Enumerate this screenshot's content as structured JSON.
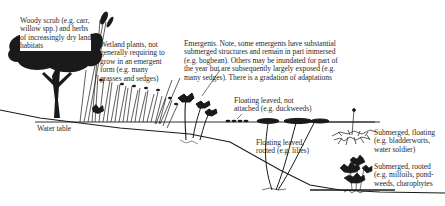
{
  "diagram": {
    "type": "wetland-plant-zonation-cross-section",
    "colors": {
      "ink": "#1a1a1a",
      "text": "#2b2b2b",
      "background": "#ffffff"
    },
    "water_table_label": "Water table",
    "zones": [
      {
        "id": "woody-scrub",
        "text": "Woody scrub (e.g. carr,\nwillow spp.) and herbs\nof increasingly dry land\nhabitats"
      },
      {
        "id": "wetland-plants",
        "text": "Wetland plants, not\ngenerally requiring to\ngrow in an emergent\nform (e.g. many\ngrasses and sedges)"
      },
      {
        "id": "emergents",
        "text": "Emergents. Note, some emergents have substantial\nsubmerged structures and remain in part immersed\n(e.g. bogbean). Others may be inundated for part of\nthe year but are subsequently largely exposed (e.g.\nmany sedges). There is a gradation of adaptations"
      },
      {
        "id": "floating-not-attached",
        "text": "Floating leaved, not\nattached (e.g. duckweeds)"
      },
      {
        "id": "floating-rooted",
        "text": "Floating leaved,\nrooted (e.g. lilies)"
      },
      {
        "id": "submerged-floating",
        "text": "Submerged, floating\n(e.g. bladderworts,\nwater soldier)"
      },
      {
        "id": "submerged-rooted",
        "text": "Submerged, rooted\n(e.g. milfoils, pond-\nweeds, charophytes"
      }
    ]
  }
}
